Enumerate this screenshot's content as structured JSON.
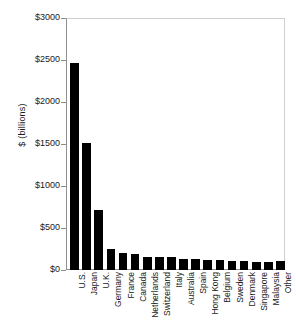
{
  "chart_data": {
    "type": "bar",
    "title": "",
    "subtitle": "",
    "xlabel": "",
    "ylabel": "$ (billions)",
    "ylim": [
      0,
      3000
    ],
    "ytick_labels": [
      "$0",
      "$500",
      "$1000",
      "$1500",
      "$2000",
      "$2500",
      "$3000"
    ],
    "ytick_values": [
      0,
      500,
      1000,
      1500,
      2000,
      2500,
      3000
    ],
    "grid": false,
    "legend": "none",
    "bar_color": "#000000",
    "categories": [
      "U.S.",
      "Japan",
      "U.K.",
      "Germany",
      "France",
      "Canada",
      "Netherlands",
      "Switzerland",
      "Italy",
      "Australia",
      "Spain",
      "Hong Kong",
      "Belgium",
      "Sweden",
      "Denmark",
      "Singapore",
      "Malaysia",
      "Other"
    ],
    "values": [
      2465,
      1510,
      710,
      250,
      200,
      195,
      160,
      155,
      150,
      135,
      130,
      125,
      115,
      110,
      105,
      100,
      95,
      110
    ]
  }
}
